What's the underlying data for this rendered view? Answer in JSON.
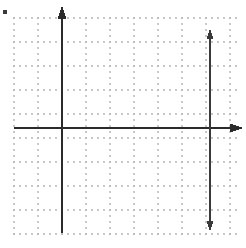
{
  "figure": {
    "canvas": {
      "width": 246,
      "height": 248,
      "background": "#ffffff"
    },
    "grid": {
      "type": "dot-grid",
      "left": 14,
      "top": 18,
      "right": 238,
      "bottom": 234,
      "minor_spacing": 6,
      "major_spacing": 24,
      "dot_color": "#c9c9c9",
      "dot_radius": 0.85,
      "major_dot_color": "#bdbdbd",
      "major_dot_radius": 1.05,
      "columns": 10,
      "rows": 9
    },
    "axes": {
      "stroke": "#2b2b2b",
      "stroke_width": 2.6,
      "origin_x": 62,
      "origin_y": 128,
      "y_axis": {
        "label": "vertical-axis",
        "x": 62,
        "top": 6,
        "bottom": 233,
        "arrow_top": true,
        "arrow_bottom": false
      },
      "x_axis": {
        "label": "horizontal-axis",
        "y": 128,
        "left": 14,
        "right": 243,
        "arrow_left": false,
        "arrow_right": true
      }
    },
    "annotations": [
      {
        "name": "double-headed-vertical-arrow",
        "type": "double-arrow-vertical",
        "x": 210,
        "top": 28,
        "bottom": 232,
        "stroke": "#3a3a3a",
        "stroke_width": 1.9
      },
      {
        "name": "corner-mark",
        "type": "square-dot",
        "x": 5,
        "y": 12,
        "size": 4,
        "color": "#3a3a3a"
      }
    ]
  },
  "chart_data": {
    "type": "scatter",
    "title": "",
    "xlabel": "",
    "ylabel": "",
    "grid": true,
    "legend": false,
    "series": [],
    "x": [],
    "values": [],
    "xlim": [
      -8,
      15
    ],
    "ylim": [
      -11,
      13
    ]
  }
}
